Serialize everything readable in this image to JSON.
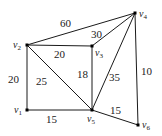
{
  "diagram": {
    "type": "weighted-undirected-graph",
    "vertices": [
      {
        "id": "v1",
        "label": "v",
        "sub": "1",
        "x": 27,
        "y": 110
      },
      {
        "id": "v2",
        "label": "v",
        "sub": "2",
        "x": 27,
        "y": 45
      },
      {
        "id": "v3",
        "label": "v",
        "sub": "3",
        "x": 92,
        "y": 46
      },
      {
        "id": "v4",
        "label": "v",
        "sub": "4",
        "x": 135,
        "y": 13
      },
      {
        "id": "v5",
        "label": "v",
        "sub": "5",
        "x": 92,
        "y": 110
      },
      {
        "id": "v6",
        "label": "v",
        "sub": "6",
        "x": 138,
        "y": 125
      }
    ],
    "edges": [
      {
        "from": "v2",
        "to": "v4",
        "weight": "60"
      },
      {
        "from": "v2",
        "to": "v3",
        "weight": "20"
      },
      {
        "from": "v3",
        "to": "v4",
        "weight": "30"
      },
      {
        "from": "v2",
        "to": "v1",
        "weight": "20"
      },
      {
        "from": "v2",
        "to": "v5",
        "weight": "25"
      },
      {
        "from": "v3",
        "to": "v5",
        "weight": "18"
      },
      {
        "from": "v4",
        "to": "v5",
        "weight": "35"
      },
      {
        "from": "v4",
        "to": "v6",
        "weight": "10"
      },
      {
        "from": "v1",
        "to": "v5",
        "weight": "15"
      },
      {
        "from": "v5",
        "to": "v6",
        "weight": "15"
      }
    ]
  }
}
